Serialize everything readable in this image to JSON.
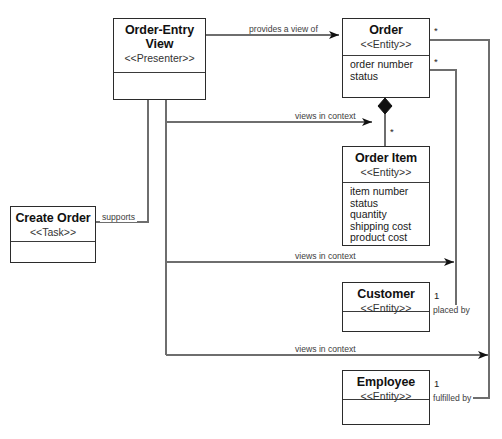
{
  "diagram": {
    "line_color": "#6e6e6e",
    "border_color": "#2b2b2b",
    "classes": [
      {
        "id": "order-entry-view",
        "name": "Order-Entry",
        "name2": "View",
        "stereotype": "<<Presenter>>",
        "attributes": []
      },
      {
        "id": "create-order",
        "name": "Create Order",
        "stereotype": "<<Task>>",
        "attributes": []
      },
      {
        "id": "order",
        "name": "Order",
        "stereotype": "<<Entity>>",
        "attributes": [
          "order number",
          "status"
        ]
      },
      {
        "id": "order-item",
        "name": "Order Item",
        "stereotype": "<<Entity>>",
        "attributes": [
          "item number",
          "status",
          "quantity",
          "shipping cost",
          "product cost"
        ]
      },
      {
        "id": "customer",
        "name": "Customer",
        "stereotype": "<<Entity>>",
        "attributes": []
      },
      {
        "id": "employee",
        "name": "Employee",
        "stereotype": "<<Entity>>",
        "attributes": []
      }
    ],
    "edge_labels": {
      "provides_a_view_of": "provides a view of",
      "supports": "supports",
      "views_in_context_1": "views in context",
      "views_in_context_2": "views in context",
      "views_in_context_3": "views in context",
      "placed_by": "placed by",
      "fulfilled_by": "fulfilled by"
    },
    "multiplicities": {
      "order_to_employee": "*",
      "order_to_customer": "*",
      "order_to_order_item": "*",
      "customer_end": "1",
      "employee_end": "1"
    }
  }
}
